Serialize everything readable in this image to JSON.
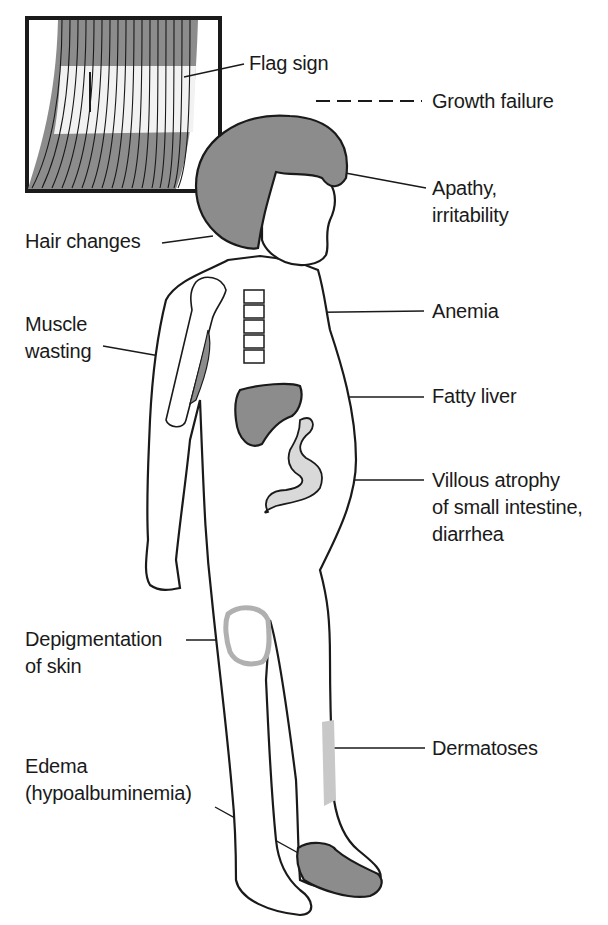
{
  "figure": {
    "colors": {
      "line": "#1a1a1a",
      "shade": "#8c8c8c",
      "light_shade": "#bdbdbd",
      "background": "#ffffff"
    }
  },
  "labels": {
    "flag_sign": {
      "lines": [
        "Flag sign"
      ]
    },
    "growth_failure": {
      "lines": [
        "Growth failure"
      ]
    },
    "apathy": {
      "lines": [
        "Apathy,",
        "irritability"
      ]
    },
    "hair_changes": {
      "lines": [
        "Hair changes"
      ]
    },
    "anemia": {
      "lines": [
        "Anemia"
      ]
    },
    "muscle_wasting": {
      "lines": [
        "Muscle",
        "wasting"
      ]
    },
    "fatty_liver": {
      "lines": [
        "Fatty liver"
      ]
    },
    "villous_atrophy": {
      "lines": [
        "Villous atrophy",
        "of small intestine,",
        "diarrhea"
      ]
    },
    "depigmentation": {
      "lines": [
        "Depigmentation",
        "of skin"
      ]
    },
    "dermatoses": {
      "lines": [
        "Dermatoses"
      ]
    },
    "edema": {
      "lines": [
        "Edema",
        "(hypoalbuminemia)"
      ]
    }
  }
}
